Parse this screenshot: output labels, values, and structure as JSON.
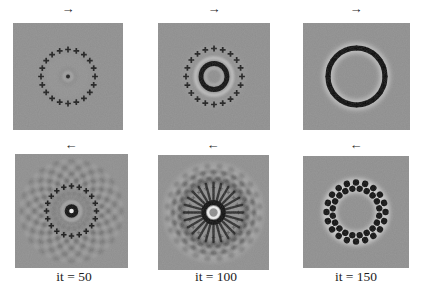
{
  "figure": {
    "colors": {
      "page_bg": "#ffffff",
      "panel_bg": "#8e8e8e",
      "ink": "#141414",
      "halo": "#e0e0e0",
      "label_color": "#1c1c1c"
    },
    "transducer_marker": {
      "glyph": "+",
      "count": 20
    },
    "panels": [
      {
        "arrow": "→",
        "label": "",
        "pattern": "point-source-in-transducer-ring"
      },
      {
        "arrow": "→",
        "label": "",
        "pattern": "expanding-wavefront-ring"
      },
      {
        "arrow": "→",
        "label": "",
        "pattern": "wavefront-reaching-transducers"
      },
      {
        "arrow": "←",
        "label": "it = 50",
        "pattern": "time-reversed-interference-flower"
      },
      {
        "arrow": "←",
        "label": "it = 100",
        "pattern": "time-reversed-converging-spokes"
      },
      {
        "arrow": "←",
        "label": "it = 150",
        "pattern": "time-reversed-beaded-ring"
      }
    ]
  }
}
